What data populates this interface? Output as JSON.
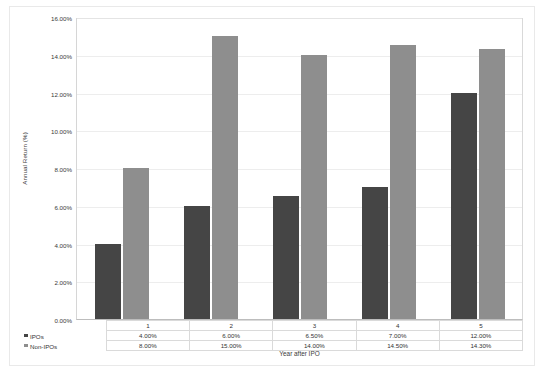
{
  "chart_data": {
    "type": "bar",
    "title": "",
    "xlabel": "Year after IPO",
    "ylabel": "Annual Return (%)",
    "categories": [
      "1",
      "2",
      "3",
      "4",
      "5"
    ],
    "series": [
      {
        "name": "IPOs",
        "values": [
          4.0,
          6.0,
          6.5,
          7.0,
          12.0
        ],
        "labels": [
          "4.00%",
          "6.00%",
          "6.50%",
          "7.00%",
          "12.00%"
        ],
        "color": "#454545"
      },
      {
        "name": "Non-IPOs",
        "values": [
          8.0,
          15.0,
          14.0,
          14.5,
          14.3
        ],
        "labels": [
          "8.00%",
          "15.00%",
          "14.00%",
          "14.50%",
          "14.30%"
        ],
        "color": "#8e8e8e"
      }
    ],
    "ylim": [
      0,
      16
    ],
    "ytick_labels": [
      "16.00%",
      "14.00%",
      "12.00%",
      "10.00%",
      "8.00%",
      "6.00%",
      "4.00%",
      "2.00%",
      "0.00%"
    ],
    "ytick_values": [
      16,
      14,
      12,
      10,
      8,
      6,
      4,
      2,
      0
    ],
    "grid": true,
    "legend_position": "data-table",
    "data_table_visible": true
  }
}
